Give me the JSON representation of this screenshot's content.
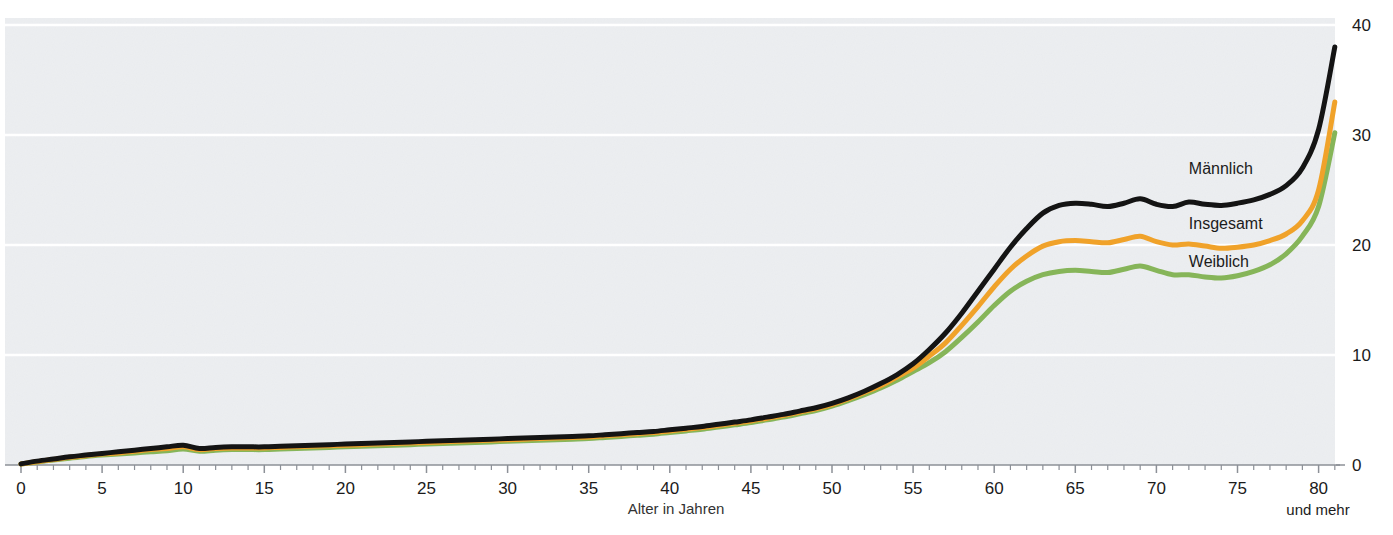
{
  "chart_data": {
    "type": "line",
    "title": "",
    "xlabel": "Alter in Jahren",
    "ylabel": "",
    "xlim": [
      0,
      81
    ],
    "ylim": [
      0,
      40
    ],
    "grid": true,
    "legend_position": "inline-right",
    "xticks_major": [
      0,
      5,
      10,
      15,
      20,
      25,
      30,
      35,
      40,
      45,
      50,
      55,
      60,
      65,
      70,
      75,
      80
    ],
    "xtick_labels": [
      "0",
      "5",
      "10",
      "15",
      "20",
      "25",
      "30",
      "35",
      "40",
      "45",
      "50",
      "55",
      "60",
      "65",
      "70",
      "75",
      "80"
    ],
    "xtick_minor_step": 1,
    "yticks": [
      0,
      10,
      20,
      30,
      40
    ],
    "ytick_labels": [
      "0",
      "10",
      "20",
      "30",
      "40"
    ],
    "axis_note": "und mehr",
    "x": [
      0,
      1,
      2,
      3,
      4,
      5,
      6,
      7,
      8,
      9,
      10,
      11,
      12,
      13,
      14,
      15,
      16,
      17,
      18,
      19,
      20,
      21,
      22,
      23,
      24,
      25,
      26,
      27,
      28,
      29,
      30,
      31,
      32,
      33,
      34,
      35,
      36,
      37,
      38,
      39,
      40,
      41,
      42,
      43,
      44,
      45,
      46,
      47,
      48,
      49,
      50,
      51,
      52,
      53,
      54,
      55,
      56,
      57,
      58,
      59,
      60,
      61,
      62,
      63,
      64,
      65,
      66,
      67,
      68,
      69,
      70,
      71,
      72,
      73,
      74,
      75,
      76,
      77,
      78,
      79,
      80,
      81
    ],
    "series": [
      {
        "name": "Männlich",
        "color": "#141414",
        "label": "Männlich",
        "label_x": 72,
        "label_y": 26.5,
        "values": [
          0.1,
          0.35,
          0.55,
          0.75,
          0.9,
          1.05,
          1.2,
          1.35,
          1.5,
          1.65,
          1.8,
          1.5,
          1.6,
          1.65,
          1.65,
          1.65,
          1.7,
          1.75,
          1.8,
          1.85,
          1.9,
          1.95,
          2.0,
          2.05,
          2.1,
          2.15,
          2.2,
          2.25,
          2.3,
          2.35,
          2.4,
          2.45,
          2.5,
          2.55,
          2.6,
          2.65,
          2.75,
          2.85,
          2.95,
          3.05,
          3.2,
          3.35,
          3.5,
          3.7,
          3.9,
          4.1,
          4.35,
          4.6,
          4.9,
          5.2,
          5.6,
          6.1,
          6.7,
          7.4,
          8.2,
          9.2,
          10.5,
          12.0,
          13.8,
          15.8,
          17.8,
          19.8,
          21.5,
          22.9,
          23.6,
          23.8,
          23.7,
          23.5,
          23.8,
          24.2,
          23.7,
          23.5,
          23.9,
          23.7,
          23.6,
          23.8,
          24.1,
          24.6,
          25.4,
          27.0,
          30.5,
          38.0
        ]
      },
      {
        "name": "Insgesamt",
        "color": "#F0A22A",
        "label": "Insgesamt",
        "label_x": 72,
        "label_y": 21.5,
        "values": [
          0.1,
          0.3,
          0.5,
          0.7,
          0.85,
          1.0,
          1.1,
          1.25,
          1.4,
          1.5,
          1.65,
          1.4,
          1.5,
          1.55,
          1.55,
          1.55,
          1.6,
          1.65,
          1.7,
          1.75,
          1.8,
          1.85,
          1.9,
          1.95,
          2.0,
          2.05,
          2.1,
          2.15,
          2.2,
          2.25,
          2.3,
          2.35,
          2.4,
          2.45,
          2.5,
          2.55,
          2.65,
          2.75,
          2.85,
          2.95,
          3.1,
          3.25,
          3.4,
          3.6,
          3.8,
          4.0,
          4.25,
          4.5,
          4.8,
          5.1,
          5.5,
          6.0,
          6.6,
          7.2,
          8.0,
          8.8,
          9.9,
          11.1,
          12.7,
          14.4,
          16.2,
          17.8,
          19.0,
          19.9,
          20.3,
          20.4,
          20.3,
          20.2,
          20.5,
          20.8,
          20.3,
          20.0,
          20.1,
          19.9,
          19.7,
          19.8,
          20.0,
          20.4,
          21.0,
          22.2,
          25.0,
          33.0
        ]
      },
      {
        "name": "Weiblich",
        "color": "#86B559",
        "label": "Weiblich",
        "label_x": 72,
        "label_y": 18.0,
        "values": [
          0.1,
          0.28,
          0.45,
          0.62,
          0.78,
          0.9,
          1.0,
          1.1,
          1.2,
          1.3,
          1.45,
          1.25,
          1.35,
          1.4,
          1.4,
          1.4,
          1.45,
          1.5,
          1.55,
          1.6,
          1.65,
          1.7,
          1.75,
          1.8,
          1.85,
          1.9,
          1.95,
          2.0,
          2.05,
          2.1,
          2.15,
          2.2,
          2.25,
          2.3,
          2.35,
          2.4,
          2.5,
          2.6,
          2.7,
          2.8,
          2.95,
          3.1,
          3.25,
          3.45,
          3.65,
          3.85,
          4.1,
          4.35,
          4.65,
          4.95,
          5.35,
          5.85,
          6.4,
          7.0,
          7.7,
          8.5,
          9.3,
          10.3,
          11.6,
          13.0,
          14.5,
          15.8,
          16.7,
          17.3,
          17.6,
          17.7,
          17.6,
          17.5,
          17.8,
          18.1,
          17.7,
          17.3,
          17.3,
          17.1,
          17.0,
          17.2,
          17.6,
          18.2,
          19.2,
          20.8,
          23.5,
          30.2
        ]
      }
    ]
  },
  "palette": {
    "plot_background": "#eceef1",
    "gridline": "#ffffff",
    "axis": "#8c9097",
    "text": "#1b1b1b"
  },
  "plot_geometry": {
    "left": 5,
    "right": 1335,
    "top": 18,
    "bottom": 465,
    "x_origin_px": 21,
    "px_per_year": 16.22,
    "px_per_unit": 11.0
  }
}
